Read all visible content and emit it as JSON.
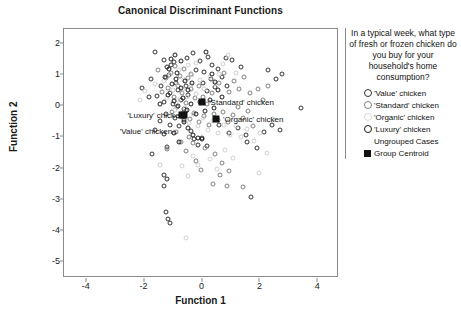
{
  "chart_data": {
    "type": "scatter",
    "title": "Canonical Discriminant Functions",
    "xlabel": "Function 1",
    "ylabel": "Function 2",
    "xlim": [
      -4.75,
      4.75
    ],
    "ylim": [
      -5.55,
      2.45
    ],
    "xticks": [
      "-4",
      "-2",
      "0",
      "2",
      "4"
    ],
    "xtick_values": [
      -4,
      -2,
      0,
      2,
      4
    ],
    "yticks": [
      "2",
      "1",
      "0",
      "-1",
      "-2",
      "-3",
      "-4",
      "-5"
    ],
    "ytick_values": [
      2,
      1,
      0,
      -1,
      -2,
      -3,
      -4,
      -5
    ],
    "grid": false,
    "legend_position": "right",
    "series": [
      {
        "name": "'Value' chicken",
        "marker": "open-circle",
        "color": "#333333",
        "points": [
          [
            -1.75,
            0.83
          ],
          [
            -1.62,
            1.7
          ],
          [
            -1.3,
            1.45
          ],
          [
            -1.18,
            1.22
          ],
          [
            -1.05,
            1.3
          ],
          [
            -1.12,
            0.96
          ],
          [
            -0.95,
            1.38
          ],
          [
            -0.88,
            0.72
          ],
          [
            -1.4,
            0.62
          ],
          [
            -1.55,
            0.3
          ],
          [
            -1.3,
            0.12
          ],
          [
            -1.1,
            0.4
          ],
          [
            -0.98,
            0.05
          ],
          [
            -0.8,
            0.48
          ],
          [
            -0.72,
            0.18
          ],
          [
            -0.62,
            -0.12
          ],
          [
            -0.55,
            0.62
          ],
          [
            -0.45,
            0.32
          ],
          [
            -1.22,
            -0.28
          ],
          [
            -1.45,
            -0.52
          ],
          [
            -1.62,
            -0.78
          ],
          [
            -1.3,
            -0.92
          ],
          [
            -1.08,
            -0.62
          ],
          [
            -0.92,
            -0.4
          ],
          [
            -0.78,
            -0.68
          ],
          [
            -0.6,
            -0.48
          ],
          [
            -1.8,
            0.28
          ],
          [
            -2.05,
            0.55
          ],
          [
            -1.72,
            -1.58
          ],
          [
            -1.18,
            -1.35
          ],
          [
            -1.28,
            -2.25
          ],
          [
            -1.2,
            -2.38
          ],
          [
            -1.3,
            -2.58
          ],
          [
            -1.22,
            -3.42
          ],
          [
            -1.15,
            -3.65
          ],
          [
            -1.1,
            -3.78
          ],
          [
            -0.5,
            1.52
          ],
          [
            -0.3,
            1.68
          ],
          [
            -0.18,
            1.12
          ],
          [
            -0.05,
            1.42
          ],
          [
            0.08,
            1.08
          ],
          [
            0.22,
            1.55
          ],
          [
            0.35,
            1.3
          ],
          [
            0.05,
            0.72
          ],
          [
            0.18,
            0.45
          ],
          [
            0.32,
            0.85
          ],
          [
            0.45,
            0.58
          ],
          [
            0.58,
            1.18
          ],
          [
            0.72,
            0.92
          ],
          [
            0.88,
            0.62
          ],
          [
            -0.38,
            -0.82
          ],
          [
            -0.25,
            -1.08
          ],
          [
            -0.12,
            -1.28
          ],
          [
            0.02,
            -1.05
          ],
          [
            0.18,
            -1.32
          ],
          [
            0.62,
            -0.62
          ],
          [
            0.95,
            -0.88
          ],
          [
            1.25,
            -0.72
          ],
          [
            1.55,
            -0.95
          ],
          [
            1.72,
            -2.95
          ],
          [
            1.58,
            -1.18
          ],
          [
            1.92,
            -1.38
          ],
          [
            2.15,
            -0.85
          ],
          [
            2.45,
            -0.62
          ],
          [
            2.72,
            -0.78
          ],
          [
            3.42,
            -0.08
          ],
          [
            2.3,
            1.12
          ],
          [
            2.58,
            0.85
          ],
          [
            2.78,
            1.0
          ],
          [
            1.35,
            1.22
          ],
          [
            1.05,
            1.45
          ],
          [
            0.85,
            1.52
          ]
        ]
      },
      {
        "name": "'Standard' chicken",
        "marker": "open-circle",
        "color": "#808080",
        "points": [
          [
            -1.5,
            1.12
          ],
          [
            -1.22,
            0.88
          ],
          [
            -1.05,
            1.05
          ],
          [
            -0.9,
            1.25
          ],
          [
            -0.75,
            0.95
          ],
          [
            -0.62,
            1.15
          ],
          [
            -0.48,
            0.88
          ],
          [
            -0.35,
            1.02
          ],
          [
            -1.38,
            0.42
          ],
          [
            -1.15,
            0.55
          ],
          [
            -0.95,
            0.28
          ],
          [
            -0.82,
            0.62
          ],
          [
            -0.68,
            0.38
          ],
          [
            -0.52,
            0.08
          ],
          [
            -0.38,
            0.52
          ],
          [
            -0.22,
            0.22
          ],
          [
            -0.08,
            0.62
          ],
          [
            0.05,
            0.28
          ],
          [
            0.2,
            0.05
          ],
          [
            0.35,
            0.38
          ],
          [
            -1.02,
            -0.22
          ],
          [
            -0.85,
            -0.05
          ],
          [
            -0.7,
            -0.32
          ],
          [
            -0.55,
            -0.18
          ],
          [
            -0.4,
            -0.45
          ],
          [
            -0.25,
            -0.25
          ],
          [
            -0.1,
            -0.55
          ],
          [
            0.08,
            -0.35
          ],
          [
            0.25,
            -0.62
          ],
          [
            0.42,
            -0.28
          ],
          [
            0.58,
            -0.48
          ],
          [
            0.75,
            -0.22
          ],
          [
            0.92,
            -0.55
          ],
          [
            1.08,
            -0.32
          ],
          [
            1.25,
            -0.05
          ],
          [
            1.42,
            -0.42
          ],
          [
            1.6,
            -0.18
          ],
          [
            1.78,
            -0.68
          ],
          [
            1.95,
            0.52
          ],
          [
            2.12,
            0.18
          ],
          [
            0.62,
            0.72
          ],
          [
            0.78,
            1.05
          ],
          [
            0.95,
            0.42
          ],
          [
            1.12,
            0.78
          ],
          [
            1.3,
            0.52
          ],
          [
            1.48,
            0.92
          ],
          [
            1.68,
            0.38
          ],
          [
            2.3,
            0.62
          ],
          [
            -0.42,
            -1.02
          ],
          [
            -0.28,
            -1.22
          ],
          [
            0.12,
            -1.38
          ],
          [
            0.45,
            -1.55
          ],
          [
            0.72,
            -1.85
          ],
          [
            0.95,
            -2.12
          ],
          [
            -0.18,
            -1.78
          ],
          [
            -0.02,
            -2.08
          ],
          [
            0.38,
            -2.52
          ],
          [
            0.65,
            -2.25
          ],
          [
            0.88,
            -2.58
          ],
          [
            1.42,
            -2.62
          ],
          [
            -0.55,
            -1.48
          ],
          [
            -0.72,
            -1.18
          ],
          [
            -0.88,
            -0.85
          ],
          [
            -1.2,
            -1.42
          ]
        ]
      },
      {
        "name": "'Organic' chicken",
        "marker": "open-circle",
        "color": "#d0d0d0",
        "points": [
          [
            -1.28,
            0.78
          ],
          [
            -1.08,
            0.98
          ],
          [
            -0.92,
            0.68
          ],
          [
            -0.78,
            1.12
          ],
          [
            -0.62,
            0.82
          ],
          [
            -0.48,
            1.28
          ],
          [
            -0.32,
            0.98
          ],
          [
            -0.18,
            1.35
          ],
          [
            -1.18,
            0.22
          ],
          [
            -0.98,
            0.48
          ],
          [
            -0.82,
            0.18
          ],
          [
            -0.65,
            0.52
          ],
          [
            -0.5,
            0.25
          ],
          [
            -0.35,
            0.65
          ],
          [
            -0.2,
            0.35
          ],
          [
            -0.05,
            0.82
          ],
          [
            0.1,
            0.52
          ],
          [
            0.28,
            0.92
          ],
          [
            0.45,
            0.68
          ],
          [
            0.62,
            1.02
          ],
          [
            -0.9,
            -0.15
          ],
          [
            -0.75,
            -0.38
          ],
          [
            -0.58,
            -0.08
          ],
          [
            -0.42,
            -0.58
          ],
          [
            -0.28,
            -0.28
          ],
          [
            -0.12,
            -0.68
          ],
          [
            0.05,
            -0.42
          ],
          [
            0.22,
            -0.78
          ],
          [
            0.4,
            -0.52
          ],
          [
            0.58,
            -0.88
          ],
          [
            0.78,
            -0.62
          ],
          [
            0.98,
            -0.95
          ],
          [
            1.18,
            -0.68
          ],
          [
            1.38,
            -1.02
          ],
          [
            1.58,
            -0.75
          ],
          [
            1.8,
            -1.15
          ],
          [
            2.02,
            -0.88
          ],
          [
            2.25,
            -1.52
          ],
          [
            2.48,
            -0.45
          ],
          [
            1.98,
            -2.18
          ],
          [
            -0.3,
            -1.62
          ],
          [
            -0.12,
            -1.92
          ],
          [
            0.28,
            -1.72
          ],
          [
            0.52,
            -2.05
          ],
          [
            0.82,
            -1.45
          ],
          [
            1.08,
            -1.68
          ],
          [
            -0.48,
            -2.28
          ],
          [
            -0.68,
            -1.95
          ],
          [
            -0.52,
            -4.25
          ],
          [
            0.75,
            1.32
          ],
          [
            0.92,
            1.62
          ],
          [
            1.18,
            1.05
          ],
          [
            -1.45,
            -1.92
          ],
          [
            -1.6,
            0.68
          ],
          [
            -1.95,
            0.45
          ],
          [
            -2.12,
            0.18
          ]
        ]
      },
      {
        "name": "'Luxury' chicken",
        "marker": "open-circle",
        "color": "#1a1a1a",
        "points": [
          [
            -1.05,
            1.48
          ],
          [
            -0.92,
            1.62
          ],
          [
            -1.12,
            1.18
          ],
          [
            -0.85,
            1.05
          ],
          [
            -0.7,
            1.42
          ],
          [
            -1.25,
            0.92
          ],
          [
            -1.02,
            0.68
          ],
          [
            -0.88,
            0.85
          ],
          [
            -0.72,
            0.55
          ],
          [
            -0.58,
            0.78
          ],
          [
            -0.45,
            0.48
          ],
          [
            -0.32,
            0.72
          ],
          [
            -1.15,
            0.32
          ],
          [
            -0.95,
            0.15
          ],
          [
            -0.8,
            -0.02
          ],
          [
            -0.65,
            0.22
          ],
          [
            -0.5,
            -0.15
          ],
          [
            -0.35,
            0.05
          ],
          [
            -0.2,
            -0.28
          ],
          [
            -0.05,
            0.12
          ],
          [
            0.12,
            -0.18
          ],
          [
            0.28,
            0.18
          ],
          [
            0.42,
            -0.08
          ],
          [
            0.15,
            1.7
          ],
          [
            0.48,
            0.75
          ],
          [
            0.35,
            1.02
          ],
          [
            0.58,
            0.48
          ],
          [
            0.72,
            0.25
          ],
          [
            -0.62,
            -0.55
          ],
          [
            -0.45,
            -0.72
          ],
          [
            -0.28,
            -0.95
          ],
          [
            -0.12,
            -1.05
          ],
          [
            0.02,
            -1.08
          ],
          [
            -0.78,
            -1.18
          ],
          [
            -0.95,
            -0.88
          ],
          [
            -1.42,
            0.05
          ]
        ]
      }
    ],
    "centroids": [
      {
        "label": "'Luxury' chicken",
        "x": -0.62,
        "y": -0.3,
        "label_dx": -56,
        "label_dy": 0
      },
      {
        "label": "'Standard' chicken",
        "x": 0.02,
        "y": 0.1,
        "label_dx": 7,
        "label_dy": 0
      },
      {
        "label": "'Value' chicken",
        "x": -0.68,
        "y": -0.32,
        "label_dx": -62,
        "label_dy": 16
      },
      {
        "label": "'Organic' chicken",
        "x": 0.5,
        "y": -0.45,
        "label_dx": 7,
        "label_dy": 0
      }
    ]
  },
  "legend": {
    "title": "In a typical week, what type of fresh or frozen chicken do you buy for your household's home consumption?",
    "items": [
      {
        "label": "'Value' chicken",
        "swatch": "open-circle",
        "color": "#333333"
      },
      {
        "label": "'Standard' chicken",
        "swatch": "open-circle",
        "color": "#808080"
      },
      {
        "label": "'Organic' chicken",
        "swatch": "open-circle",
        "color": "#d8d8d8"
      },
      {
        "label": "'Luxury' chicken",
        "swatch": "open-circle",
        "color": "#1a1a1a"
      },
      {
        "label": "Ungrouped Cases",
        "swatch": "none",
        "color": "#ffffff"
      },
      {
        "label": "Group Centroid",
        "swatch": "filled-square",
        "color": "#111111"
      }
    ]
  }
}
